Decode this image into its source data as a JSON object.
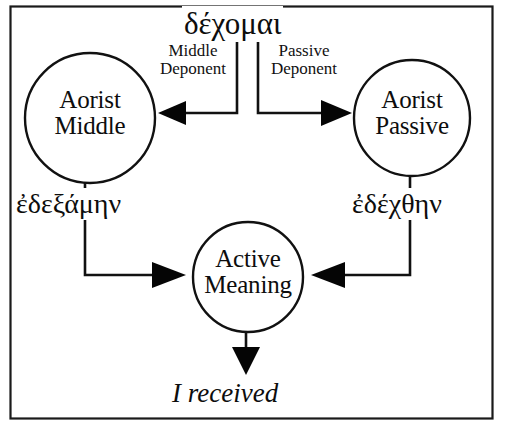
{
  "diagram": {
    "frame": {
      "border_color": "#1a1a1a"
    },
    "root_verb": "δέχομαι",
    "gloss": "I received",
    "nodes": [
      {
        "id": "aorist-middle",
        "line1": "Aorist",
        "line2": "Middle"
      },
      {
        "id": "aorist-passive",
        "line1": "Aorist",
        "line2": "Passive"
      },
      {
        "id": "active-meaning",
        "line1": "Active",
        "line2": "Meaning"
      }
    ],
    "edge_labels": [
      {
        "id": "middle-deponent",
        "line1": "Middle",
        "line2": "Deponent"
      },
      {
        "id": "passive-deponent",
        "line1": "Passive",
        "line2": "Deponent"
      }
    ],
    "form_labels": [
      {
        "id": "aorist-middle-form",
        "text": "ἐδεξάμην"
      },
      {
        "id": "aorist-passive-form",
        "text": "ἐδέχθην"
      }
    ]
  }
}
